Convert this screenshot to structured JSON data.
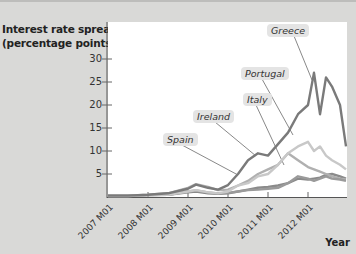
{
  "chart_data": {
    "type": "line",
    "title": "",
    "ylabel": "Interest rate spread (percentage points)",
    "xlabel": "Year",
    "ylim": [
      0,
      35
    ],
    "yticks": [
      5,
      10,
      15,
      20,
      25,
      30
    ],
    "xticks": [
      "2007 M01",
      "2008 M01",
      "2009 M01",
      "2010 M01",
      "2011 M01",
      "2012 M01"
    ],
    "grid": false,
    "legend": "callout labels on lines",
    "x": [
      2007.0,
      2007.5,
      2008.0,
      2008.5,
      2009.0,
      2009.2,
      2009.5,
      2009.75,
      2010.0,
      2010.25,
      2010.5,
      2010.75,
      2011.0,
      2011.25,
      2011.5,
      2011.75,
      2012.0,
      2012.15,
      2012.3,
      2012.45,
      2012.6,
      2012.8,
      2012.95
    ],
    "series": [
      {
        "name": "Greece",
        "color": "#7a7a7a",
        "values": [
          0.3,
          0.3,
          0.5,
          0.8,
          1.8,
          2.7,
          2.0,
          1.6,
          2.6,
          5.0,
          8.0,
          9.5,
          9.0,
          11.5,
          14.0,
          18.0,
          20.0,
          27.0,
          18.0,
          26.0,
          24.0,
          20.0,
          11.0
        ]
      },
      {
        "name": "Portugal",
        "color": "#c8c8c8",
        "values": [
          0.2,
          0.2,
          0.4,
          0.5,
          1.2,
          1.5,
          1.0,
          0.8,
          1.2,
          2.5,
          3.0,
          4.5,
          5.0,
          7.0,
          9.5,
          11.0,
          12.0,
          10.0,
          11.0,
          9.0,
          8.0,
          7.0,
          6.0
        ]
      },
      {
        "name": "Italy",
        "color": "#9a9a9a",
        "values": [
          0.3,
          0.3,
          0.4,
          0.5,
          1.2,
          1.4,
          1.0,
          0.8,
          0.9,
          1.2,
          1.5,
          1.6,
          1.8,
          2.0,
          3.0,
          4.5,
          4.0,
          3.5,
          4.0,
          4.5,
          4.0,
          3.8,
          3.5
        ]
      },
      {
        "name": "Ireland",
        "color": "#b0b0b0",
        "values": [
          0.3,
          0.3,
          0.5,
          0.8,
          2.0,
          2.8,
          2.2,
          1.5,
          1.6,
          2.5,
          3.5,
          5.0,
          6.0,
          7.0,
          9.5,
          8.0,
          6.5,
          6.0,
          5.5,
          5.0,
          4.5,
          4.0,
          3.8
        ]
      },
      {
        "name": "Spain",
        "color": "#8a8a8a",
        "values": [
          0.2,
          0.2,
          0.4,
          0.5,
          1.0,
          1.2,
          0.8,
          0.7,
          0.8,
          1.2,
          1.6,
          2.0,
          2.2,
          2.5,
          3.0,
          4.0,
          3.8,
          4.0,
          4.2,
          4.8,
          5.0,
          4.5,
          4.0
        ]
      }
    ]
  },
  "labels": {
    "y_title_line1": "Interest rate spread",
    "y_title_line2": "(percentage points)",
    "x_title": "Year",
    "yticks": [
      "30",
      "25",
      "20",
      "15",
      "10",
      "5"
    ],
    "xticks": [
      "2007 M01",
      "2008 M01",
      "2009 M01",
      "2010 M01",
      "2011 M01",
      "2012 M01"
    ],
    "callouts": {
      "greece": "Greece",
      "portugal": "Portugal",
      "italy": "Italy",
      "ireland": "Ireland",
      "spain": "Spain"
    }
  }
}
